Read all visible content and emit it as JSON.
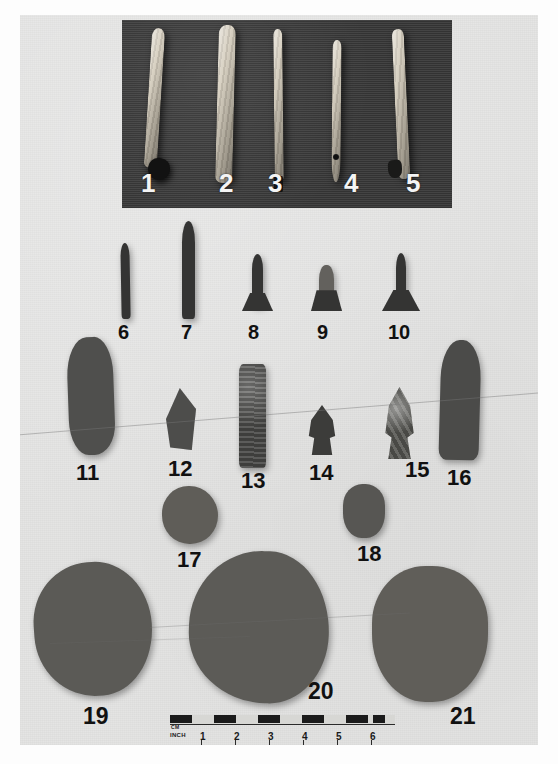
{
  "plate": {
    "kind": "archaeological-artifact-plate",
    "background_color": "#e4e4e3",
    "panel_color": "#3a3a3a",
    "page_color": "#fdfdfd",
    "label_color_light": "#f4f4f4",
    "label_color_dark": "#111111"
  },
  "rows": [
    {
      "id": "row-bone-tools",
      "on_dark_panel": true,
      "items": [
        {
          "label": "1",
          "type": "bone-awl"
        },
        {
          "label": "2",
          "type": "bone-tool"
        },
        {
          "label": "3",
          "type": "bone-pin"
        },
        {
          "label": "4",
          "type": "bone-needle-perforated"
        },
        {
          "label": "5",
          "type": "bone-awl"
        }
      ]
    },
    {
      "id": "row-small-points",
      "on_dark_panel": false,
      "items": [
        {
          "label": "6",
          "type": "drill"
        },
        {
          "label": "7",
          "type": "drill"
        },
        {
          "label": "8",
          "type": "stemmed-point"
        },
        {
          "label": "9",
          "type": "stemmed-point"
        },
        {
          "label": "10",
          "type": "stemmed-point"
        }
      ]
    },
    {
      "id": "row-bifaces",
      "on_dark_panel": false,
      "items": [
        {
          "label": "11",
          "type": "biface"
        },
        {
          "label": "12",
          "type": "scraper"
        },
        {
          "label": "13",
          "type": "celt"
        },
        {
          "label": "14",
          "type": "notched-point"
        },
        {
          "label": "15",
          "type": "notched-point"
        },
        {
          "label": "16",
          "type": "biface"
        }
      ]
    },
    {
      "id": "row-small-stones",
      "on_dark_panel": false,
      "items": [
        {
          "label": "17",
          "type": "pitted-stone"
        },
        {
          "label": "18",
          "type": "pebble"
        }
      ]
    },
    {
      "id": "row-hammerstones",
      "on_dark_panel": false,
      "items": [
        {
          "label": "19",
          "type": "hammerstone"
        },
        {
          "label": "20",
          "type": "hammerstone"
        },
        {
          "label": "21",
          "type": "mano"
        }
      ]
    }
  ],
  "scale": {
    "name": "photographic-scale-bar",
    "cm_label": "CM",
    "inch_label": "INCH",
    "inch_ticks": [
      "1",
      "2",
      "3",
      "4",
      "5",
      "6"
    ],
    "cm_segments": 8
  }
}
